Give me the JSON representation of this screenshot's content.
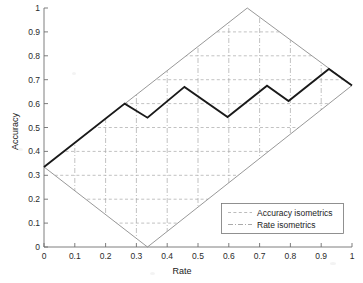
{
  "chart_data": {
    "type": "line",
    "title": "",
    "xlabel": "Rate",
    "ylabel": "Accuracy",
    "xlim": [
      0,
      1
    ],
    "ylim": [
      0,
      1
    ],
    "grid": true,
    "grid_style": "isometric dashed lines inside achievable region",
    "xticks": [
      "0",
      "0.1",
      "0.2",
      "0.3",
      "0.4",
      "0.5",
      "0.6",
      "0.7",
      "0.8",
      "0.9",
      "1"
    ],
    "xtick_values": [
      0,
      0.1,
      0.2,
      0.3,
      0.4,
      0.5,
      0.6,
      0.7,
      0.8,
      0.9,
      1
    ],
    "yticks": [
      "0",
      "0.1",
      "0.2",
      "0.3",
      "0.4",
      "0.5",
      "0.6",
      "0.7",
      "0.8",
      "0.9",
      "1"
    ],
    "ytick_values": [
      0,
      0.1,
      0.2,
      0.3,
      0.4,
      0.5,
      0.6,
      0.7,
      0.8,
      0.9,
      1
    ],
    "legend_position": "lower right",
    "legend": [
      {
        "label": "Accuracy isometrics",
        "style": "dashed",
        "color": "#a0a0a0"
      },
      {
        "label": "Rate isometrics",
        "style": "dash-dot",
        "color": "#a0a0a0"
      }
    ],
    "series": [
      {
        "name": "operating curve",
        "style": "solid-thick",
        "color": "#1a1a1a",
        "points": [
          [
            0.0,
            0.335
          ],
          [
            0.262,
            0.6
          ],
          [
            0.336,
            0.541
          ],
          [
            0.456,
            0.67
          ],
          [
            0.596,
            0.544
          ],
          [
            0.724,
            0.675
          ],
          [
            0.794,
            0.611
          ],
          [
            0.925,
            0.745
          ],
          [
            1.0,
            0.676
          ]
        ]
      },
      {
        "name": "upper envelope",
        "style": "solid-thin",
        "color": "#8c8c8c",
        "points": [
          [
            0.0,
            0.335
          ],
          [
            0.66,
            1.0
          ],
          [
            1.0,
            0.676
          ]
        ]
      },
      {
        "name": "lower envelope",
        "style": "solid-thin",
        "color": "#8c8c8c",
        "points": [
          [
            0.0,
            0.335
          ],
          [
            0.336,
            0.0
          ],
          [
            1.0,
            0.676
          ]
        ]
      }
    ],
    "accuracy_isometrics": [
      0.1,
      0.2,
      0.3,
      0.4,
      0.5,
      0.6,
      0.7,
      0.8,
      0.9
    ],
    "rate_isometrics": [
      0.1,
      0.2,
      0.3,
      0.4,
      0.5,
      0.6,
      0.7,
      0.8,
      0.9
    ]
  },
  "axes": {
    "x_title": "Rate",
    "y_title": "Accuracy"
  },
  "legend": {
    "accuracy_label": "Accuracy isometrics",
    "rate_label": "Rate isometrics"
  },
  "colors": {
    "curve": "#1a1a1a",
    "envelope": "#8c8c8c",
    "iso": "#a8a8a8",
    "axis": "#6f6f6f",
    "text": "#1d1d1d",
    "background": "#ffffff"
  }
}
